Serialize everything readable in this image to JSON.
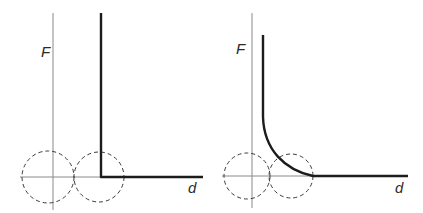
{
  "figure": {
    "panels": [
      {
        "id": "left",
        "y_label": "F",
        "x_label": "d",
        "y_label_pos": [
          41,
          57
        ],
        "x_label_pos": [
          188,
          193
        ],
        "axis": {
          "vx": 53,
          "vy_top": 13,
          "vy_bottom": 210,
          "hy": 177,
          "hx_left": 20,
          "hx_right": 124
        },
        "circles": [
          {
            "cx": 48,
            "cy": 177,
            "r": 26
          },
          {
            "cx": 99,
            "cy": 177,
            "r": 25
          }
        ],
        "curve_type": "step",
        "curve_path": "M101,13 L101,177 L203,177"
      },
      {
        "id": "right",
        "y_label": "F",
        "x_label": "d",
        "y_label_pos": [
          236,
          54
        ],
        "x_label_pos": [
          395,
          193
        ],
        "axis": {
          "vx": 252,
          "vy_top": 13,
          "vy_bottom": 208,
          "hy": 176,
          "hx_left": 222,
          "hx_right": 313
        },
        "circles": [
          {
            "cx": 247,
            "cy": 176,
            "r": 23
          },
          {
            "cx": 291,
            "cy": 176,
            "r": 22
          }
        ],
        "curve_type": "smooth-decay",
        "curve_path": "M263,35 L263,117 C264,150 285,170 313,176 L408,176"
      }
    ]
  }
}
